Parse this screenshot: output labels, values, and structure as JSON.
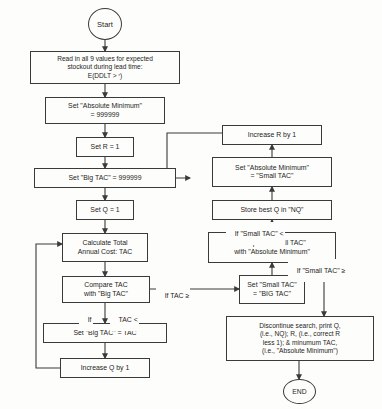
{
  "diagram": {
    "stroke_color": "#3a3a3a",
    "background_color": "#fdfdfb",
    "text_color": "#1d1d1d"
  },
  "terminators": {
    "start": "Start",
    "end": "END"
  },
  "nodes": {
    "read_inputs": "Read in all 9 values for expected\nstockout during lead time:\nE(DDLT > ʳ)",
    "set_absolute_minimum": "Set \"Absolute Minimum\"\n= 999999",
    "set_r": "Set R = 1",
    "set_big_tac": "Set \"Big TAC\" = 999999",
    "set_q": "Set Q = 1",
    "calculate_tac": "Calculate Total\nAnnual Cost: TAC",
    "compare_tac": "Compare TAC\nwith \"Big TAC\"",
    "set_big_tac_equals_tac": "Set \"Big TAC\" = TAC",
    "increase_q": "Increase Q by 1",
    "increase_r": "Increase R by 1",
    "set_absmin_small_tac": "Set \"Absolute Minimum\"\n= \"Small TAC\"",
    "store_best_q": "Store best Q in \"NQ\"",
    "compare_small_tac": "Compare \"Small TAC\"\nwith \"Absolute Minimum\"",
    "set_small_tac": "Set \"Small TAC\"\n= \"BIG TAC\"",
    "discontinue": "Discontinue search, print Q,\n(i.e., NQ); R, (i.e., correct R\nless 1); & minumum TAC,\n(i.e., \"Absolute Minimum\")"
  },
  "edge_labels": {
    "if_tac_ge": "If TAC ≥",
    "if_tac_lt_1": "If",
    "if_tac_lt_2": "TAC <",
    "if_small_tac_lt": "If \"Small TAC\" <",
    "if_small_tac_ge": "If \"Small TAC\" ≥"
  }
}
